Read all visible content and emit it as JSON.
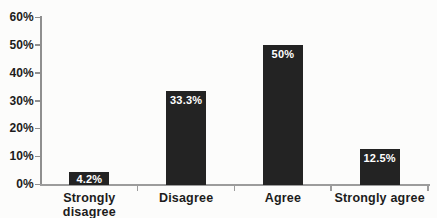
{
  "chart_data": {
    "type": "bar",
    "title": "",
    "xlabel": "",
    "ylabel": "",
    "categories": [
      "Strongly disagree",
      "Disagree",
      "Agree",
      "Strongly agree"
    ],
    "values": [
      4.2,
      33.3,
      50,
      12.5
    ],
    "bar_labels": [
      "4.2%",
      "33.3%",
      "50%",
      "12.5%"
    ],
    "y_tick_labels": [
      "0%",
      "10%",
      "20%",
      "30%",
      "40%",
      "50%",
      "60%"
    ],
    "y_tick_values": [
      0,
      10,
      20,
      30,
      40,
      50,
      60
    ],
    "ylim": [
      0,
      60
    ],
    "grid": false,
    "legend": "none",
    "colors": {
      "bar": "#232323",
      "bar_label": "#ffffff",
      "axis": "#8f8f8f",
      "baseline": "#9c9c9c",
      "text": "#1c1c1c",
      "background": "#fcfcfb"
    }
  }
}
